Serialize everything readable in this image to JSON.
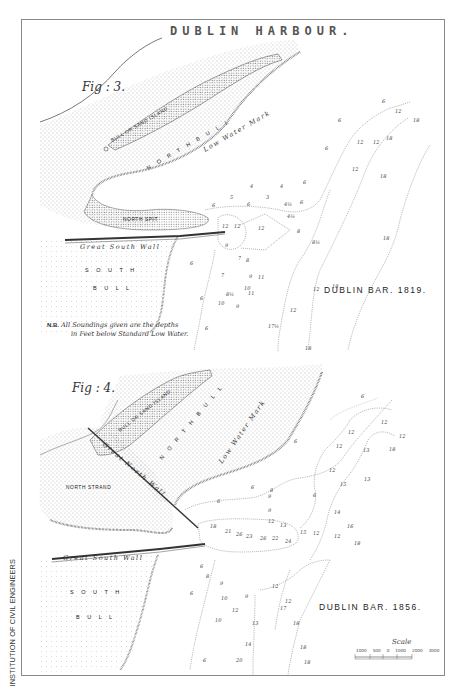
{
  "title": "DUBLIN HARBOUR.",
  "credit": "INSTITUTION OF CIVIL ENGINEERS",
  "figures": [
    {
      "label": "Fig : 3.",
      "bar_title": "DUBLIN BAR. 1819.",
      "place_labels": {
        "island": "BULL OR SAND ISLAND",
        "north_bull": "N O R T H   B U L L",
        "low_water": "Low Water Mark",
        "north_spit": "NORTH SPIT",
        "wall": "Great South Wall",
        "south": "S O U T H",
        "bull": "B U L L"
      },
      "note_prefix": "N.B.",
      "note_text": "All Soundings given are the depths",
      "note_text2": "in Feet below Standard Low Water.",
      "soundings": [
        "6",
        "12",
        "18",
        "6",
        "12",
        "12",
        "18",
        "6",
        "12",
        "18",
        "5",
        "4",
        "4",
        "3",
        "4½",
        "6",
        "6",
        "6",
        "12",
        "12",
        "9",
        "8",
        "7",
        "8½",
        "9",
        "10",
        "11",
        "11",
        "10",
        "12",
        "6",
        "6",
        "18",
        "17½",
        "12",
        "18",
        "18",
        "24"
      ]
    },
    {
      "label": "Fig : 4.",
      "bar_title": "DUBLIN BAR. 1856.",
      "place_labels": {
        "island": "BULL OR SAND ISLAND",
        "north_bull": "N O R T H   B U L L",
        "low_water": "Low Water Mark",
        "north_strand": "NORTH STRAND",
        "north_wall": "Great North Wall",
        "wall": "Great South Wall",
        "south": "S O U T H",
        "bull": "B U L L"
      },
      "soundings": [
        "6",
        "12",
        "12",
        "18",
        "18",
        "13",
        "13",
        "15",
        "12",
        "18",
        "14",
        "16",
        "12",
        "18",
        "6",
        "6",
        "6",
        "8",
        "9",
        "9",
        "10",
        "10",
        "12",
        "13",
        "14",
        "17",
        "18",
        "20",
        "18",
        "18"
      ]
    }
  ],
  "scale": {
    "title": "Scale",
    "ticks": [
      "1000",
      "500",
      "0",
      "1000",
      "2000",
      "3000"
    ],
    "unit": "feet"
  }
}
